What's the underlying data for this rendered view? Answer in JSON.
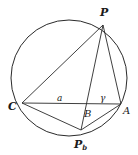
{
  "diagram": {
    "type": "geometry-circle-inscribed",
    "stroke_color": "#2a2a2a",
    "background": "#ffffff",
    "circle": {
      "cx": 69,
      "cy": 78,
      "r": 58
    },
    "points": {
      "P": {
        "x": 103,
        "y": 25
      },
      "C": {
        "x": 22,
        "y": 103
      },
      "A": {
        "x": 121,
        "y": 104
      },
      "B": {
        "x": 87,
        "y": 104
      },
      "Pb": {
        "x": 81,
        "y": 130
      }
    },
    "segments": [
      [
        "P",
        "C"
      ],
      [
        "P",
        "A"
      ],
      [
        "P",
        "Pb"
      ],
      [
        "C",
        "A"
      ],
      [
        "C",
        "Pb"
      ],
      [
        "A",
        "Pb"
      ]
    ],
    "labels": {
      "P": "P",
      "C": "C",
      "A": "A",
      "B": "B",
      "Pb_main": "P",
      "Pb_sub": "b",
      "a": "a",
      "gamma": "γ"
    }
  }
}
